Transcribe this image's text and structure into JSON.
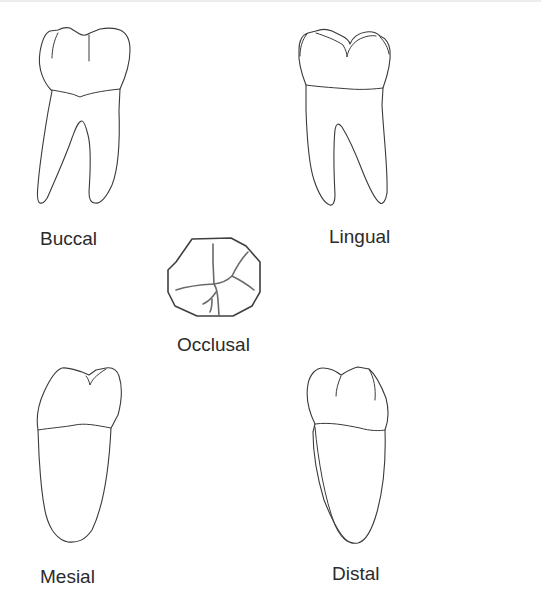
{
  "diagram": {
    "views": [
      {
        "id": "buccal",
        "label": "Buccal"
      },
      {
        "id": "lingual",
        "label": "Lingual"
      },
      {
        "id": "occlusal",
        "label": "Occlusal"
      },
      {
        "id": "mesial",
        "label": "Mesial"
      },
      {
        "id": "distal",
        "label": "Distal"
      }
    ],
    "colors": {
      "line": "#3a3a3a",
      "fissure": "#6a6a6a",
      "label": "#2b2b2b",
      "background": "#ffffff"
    }
  }
}
